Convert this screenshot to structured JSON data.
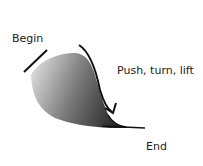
{
  "diagram": {
    "type": "brush-stroke-instruction",
    "labels": {
      "begin": "Begin",
      "action": "Push, turn, lift",
      "end": "End"
    },
    "colors": {
      "stroke_dark": "#1a1a1a",
      "stroke_light": "#bdbdbd",
      "text": "#222222"
    }
  }
}
